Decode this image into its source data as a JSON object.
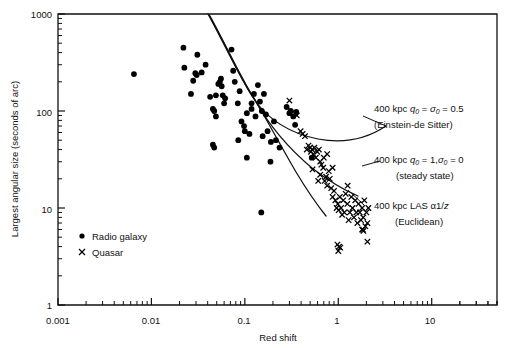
{
  "figure": {
    "width": 514,
    "height": 348,
    "background": "#ffffff",
    "ink_color": "#000000"
  },
  "chart_data": {
    "type": "scatter",
    "title": "",
    "xlabel": "Red shift",
    "ylabel": "Largest angular size (seconds of arc)",
    "xscale": "log",
    "yscale": "log",
    "xlim": [
      0.001,
      50
    ],
    "ylim": [
      1,
      1000
    ],
    "grid": false,
    "x_tick_labels": [
      "0.001",
      "0.01",
      "0.1",
      "1",
      "10"
    ],
    "x_tick_values": [
      0.001,
      0.01,
      0.1,
      1,
      10
    ],
    "y_tick_labels": [
      "1",
      "10",
      "100",
      "1000"
    ],
    "y_tick_values": [
      1,
      10,
      100,
      1000
    ],
    "legend_position": "inside-lower-left",
    "series": [
      {
        "name": "Radio galaxy",
        "marker": "filled-circle",
        "points": [
          [
            0.0065,
            240
          ],
          [
            0.022,
            450
          ],
          [
            0.0225,
            280
          ],
          [
            0.028,
            205
          ],
          [
            0.0295,
            245
          ],
          [
            0.0305,
            235
          ],
          [
            0.0265,
            150
          ],
          [
            0.031,
            380
          ],
          [
            0.0345,
            250
          ],
          [
            0.038,
            300
          ],
          [
            0.0425,
            140
          ],
          [
            0.049,
            145
          ],
          [
            0.0455,
            105
          ],
          [
            0.052,
            190
          ],
          [
            0.054,
            200
          ],
          [
            0.0555,
            215
          ],
          [
            0.0565,
            180
          ],
          [
            0.047,
            100
          ],
          [
            0.049,
            88
          ],
          [
            0.058,
            145
          ],
          [
            0.06,
            120
          ],
          [
            0.0615,
            135
          ],
          [
            0.0455,
            45
          ],
          [
            0.047,
            42
          ],
          [
            0.072,
            430
          ],
          [
            0.075,
            260
          ],
          [
            0.078,
            200
          ],
          [
            0.084,
            120
          ],
          [
            0.088,
            160
          ],
          [
            0.092,
            78
          ],
          [
            0.098,
            70
          ],
          [
            0.1,
            62
          ],
          [
            0.085,
            50
          ],
          [
            0.105,
            95
          ],
          [
            0.112,
            58
          ],
          [
            0.118,
            120
          ],
          [
            0.125,
            150
          ],
          [
            0.118,
            105
          ],
          [
            0.13,
            88
          ],
          [
            0.105,
            33
          ],
          [
            0.138,
            185
          ],
          [
            0.145,
            125
          ],
          [
            0.152,
            100
          ],
          [
            0.16,
            150
          ],
          [
            0.168,
            92
          ],
          [
            0.155,
            55
          ],
          [
            0.175,
            62
          ],
          [
            0.19,
            48
          ],
          [
            0.205,
            78
          ],
          [
            0.188,
            30
          ],
          [
            0.215,
            50
          ],
          [
            0.235,
            42
          ],
          [
            0.28,
            110
          ],
          [
            0.3,
            95
          ],
          [
            0.31,
            100
          ],
          [
            0.33,
            88
          ],
          [
            0.345,
            72
          ],
          [
            0.355,
            98
          ],
          [
            0.15,
            9
          ],
          [
            0.52,
            33
          ]
        ]
      },
      {
        "name": "Quasar",
        "marker": "x-cross",
        "points": [
          [
            0.3,
            128
          ],
          [
            0.345,
            95
          ],
          [
            0.36,
            90
          ],
          [
            0.395,
            62
          ],
          [
            0.415,
            58
          ],
          [
            0.44,
            55
          ],
          [
            0.46,
            40
          ],
          [
            0.48,
            44
          ],
          [
            0.5,
            42
          ],
          [
            0.51,
            38
          ],
          [
            0.525,
            40
          ],
          [
            0.54,
            36
          ],
          [
            0.555,
            42
          ],
          [
            0.575,
            33
          ],
          [
            0.595,
            38
          ],
          [
            0.62,
            40
          ],
          [
            0.64,
            30
          ],
          [
            0.66,
            28
          ],
          [
            0.69,
            26
          ],
          [
            0.715,
            19
          ],
          [
            0.74,
            21
          ],
          [
            0.76,
            17
          ],
          [
            0.79,
            24
          ],
          [
            0.81,
            20
          ],
          [
            0.84,
            16
          ],
          [
            0.87,
            13
          ],
          [
            0.9,
            15
          ],
          [
            0.93,
            12
          ],
          [
            0.96,
            10
          ],
          [
            0.99,
            11
          ],
          [
            1.01,
            9.5
          ],
          [
            1.04,
            13
          ],
          [
            1.07,
            10
          ],
          [
            1.1,
            8.5
          ],
          [
            1.13,
            12
          ],
          [
            1.16,
            9
          ],
          [
            1.2,
            14
          ],
          [
            1.25,
            11
          ],
          [
            1.29,
            7.5
          ],
          [
            1.33,
            9
          ],
          [
            1.38,
            13
          ],
          [
            1.42,
            10
          ],
          [
            1.47,
            8
          ],
          [
            1.52,
            12
          ],
          [
            1.56,
            9
          ],
          [
            1.6,
            7
          ],
          [
            1.65,
            11
          ],
          [
            1.7,
            9
          ],
          [
            1.75,
            7.5
          ],
          [
            1.8,
            10
          ],
          [
            1.85,
            8
          ],
          [
            1.9,
            12
          ],
          [
            1.95,
            6.5
          ],
          [
            2.0,
            9
          ],
          [
            2.05,
            7
          ],
          [
            2.1,
            10
          ],
          [
            0.98,
            4.2
          ],
          [
            1.02,
            4.0
          ],
          [
            1.05,
            3.9
          ],
          [
            1.0,
            3.6
          ],
          [
            1.8,
            6.0
          ],
          [
            1.83,
            6.0
          ],
          [
            1.86,
            5.8
          ],
          [
            2.05,
            4.5
          ],
          [
            1.26,
            17
          ],
          [
            0.87,
            26
          ],
          [
            0.61,
            19
          ],
          [
            0.64,
            22
          ],
          [
            0.53,
            25
          ],
          [
            0.7,
            33
          ],
          [
            0.76,
            36
          ]
        ]
      }
    ],
    "annotations": [
      {
        "id": "einstein-de-sitter",
        "line1_prefix": "400 kpc ",
        "line1_sym1": "q",
        "line1_sub1": "0",
        "line1_mid": " = ",
        "line1_sym2": "σ",
        "line1_sub2": "0",
        "line1_suffix": " = 0.5",
        "line2": "(Einstein-de Sitter)"
      },
      {
        "id": "steady-state",
        "line1_prefix": "400 kpc ",
        "line1_sym1": "q",
        "line1_sub1": "0",
        "line1_mid": " = 1,",
        "line1_sym2": "σ",
        "line1_sub2": "0",
        "line1_suffix": " = 0",
        "line2": "(steady state)"
      },
      {
        "id": "euclidean",
        "line1_prefix": "400 kpc LAS ",
        "line1_sym1": "α",
        "line1_sub1": "",
        "line1_mid": "1/",
        "line1_sym2": "z",
        "line1_sub2": "",
        "line1_suffix": "",
        "line2": "(Euclidean)"
      }
    ]
  },
  "axes": {
    "y_axis_title": "Largest angular size (seconds of arc)",
    "x_axis_title": "Red shift",
    "y_labels": [
      "1000",
      "100",
      "10",
      "1"
    ],
    "x_labels": [
      "0.001",
      "0.01",
      "0.1",
      "1",
      "10"
    ]
  },
  "legend": {
    "items": [
      {
        "marker": "filled-circle",
        "label": "Radio galaxy"
      },
      {
        "marker": "x-cross",
        "label": "Quasar"
      }
    ]
  }
}
